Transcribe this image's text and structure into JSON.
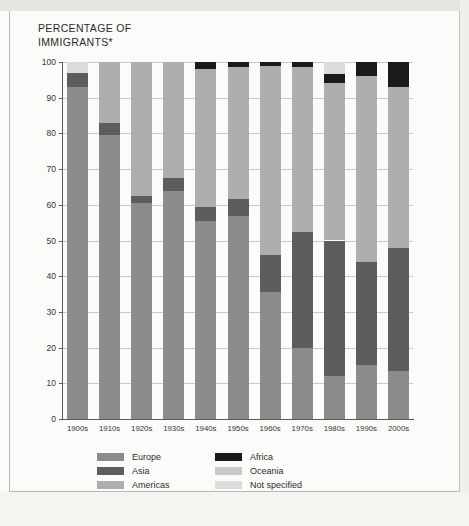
{
  "title": "PERCENTAGE OF\nIMMIGRANTS*",
  "colors": {
    "europe": "#8c8c8c",
    "asia": "#5d5d5d",
    "americas": "#aeaeae",
    "africa": "#1a1a1a",
    "oceania": "#c9c9c9",
    "not_specified": "#dcdcdc",
    "gridline": "#c9c9c4",
    "axis": "#5a5a58",
    "background": "#fbfbf9"
  },
  "legend": {
    "column_left": [
      {
        "label": "Europe",
        "color_key": "europe"
      },
      {
        "label": "Asia",
        "color_key": "asia"
      },
      {
        "label": "Americas",
        "color_key": "americas"
      }
    ],
    "column_right": [
      {
        "label": "Africa",
        "color_key": "africa"
      },
      {
        "label": "Oceania",
        "color_key": "oceania"
      },
      {
        "label": "Not specified",
        "color_key": "not_specified"
      }
    ]
  },
  "chart_data": {
    "type": "bar",
    "subtype": "stacked-bar-100-percent",
    "title": "PERCENTAGE OF IMMIGRANTS*",
    "xlabel": "",
    "ylabel": "",
    "ylim": [
      0,
      100
    ],
    "yticks": [
      0,
      10,
      20,
      30,
      40,
      50,
      60,
      70,
      80,
      90,
      100
    ],
    "grid": true,
    "legend_position": "bottom",
    "categories": [
      "1900s",
      "1910s",
      "1920s",
      "1930s",
      "1940s",
      "1950s",
      "1960s",
      "1970s",
      "1980s",
      "1990s",
      "2000s"
    ],
    "series": [
      {
        "name": "Europe",
        "color_key": "europe",
        "values": [
          93.0,
          79.5,
          60.5,
          64.0,
          55.5,
          57.0,
          35.5,
          20.0,
          12.0,
          15.0,
          13.5
        ]
      },
      {
        "name": "Asia",
        "color_key": "asia",
        "values": [
          4.0,
          3.5,
          2.0,
          3.5,
          4.0,
          4.5,
          10.5,
          32.5,
          38.0,
          29.0,
          34.5
        ]
      },
      {
        "name": "Americas",
        "color_key": "americas",
        "values": [
          0.0,
          17.0,
          37.5,
          32.5,
          38.5,
          37.0,
          53.0,
          46.0,
          44.0,
          52.0,
          45.0
        ]
      },
      {
        "name": "Africa",
        "color_key": "africa",
        "values": [
          0.0,
          0.0,
          0.0,
          0.0,
          2.0,
          1.5,
          1.0,
          1.5,
          2.5,
          4.0,
          7.0
        ]
      },
      {
        "name": "Oceania",
        "color_key": "oceania",
        "values": [
          0.0,
          0.0,
          0.0,
          0.0,
          0.0,
          0.0,
          0.0,
          0.0,
          0.0,
          0.0,
          0.0
        ]
      },
      {
        "name": "Not specified",
        "color_key": "not_specified",
        "values": [
          3.0,
          0.0,
          0.0,
          0.0,
          0.0,
          0.0,
          0.0,
          0.0,
          3.5,
          0.0,
          0.0
        ]
      }
    ]
  }
}
